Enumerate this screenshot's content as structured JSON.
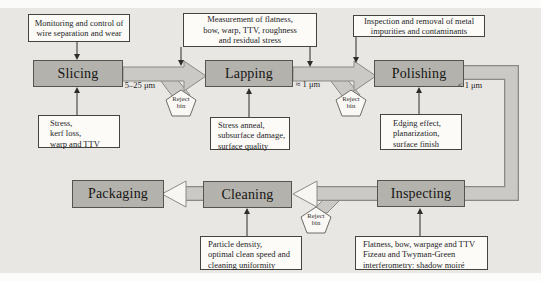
{
  "process_steps": {
    "slicing": {
      "label": "Slicing"
    },
    "lapping": {
      "label": "Lapping"
    },
    "polishing": {
      "label": "Polishing"
    },
    "packaging": {
      "label": "Packaging"
    },
    "cleaning": {
      "label": "Cleaning"
    },
    "inspecting": {
      "label": "Inspecting"
    }
  },
  "annotations": {
    "monitoring": {
      "lines": [
        "Monitoring and control of",
        "wire separation and wear"
      ]
    },
    "measurement": {
      "lines": [
        "Measurement of flatness,",
        "bow, warp, TTV, roughness",
        "and residual stress"
      ]
    },
    "inspection_removal": {
      "lines": [
        "Inspection and removal of metal",
        "impurities and contaminants"
      ]
    },
    "slicing_issues": {
      "lines": [
        "Stress,",
        "kerf loss,",
        "warp and TTV"
      ]
    },
    "lapping_issues": {
      "lines": [
        "Stress anneal,",
        "subsurface damage,",
        "surface quality"
      ]
    },
    "polishing_issues": {
      "lines": [
        "Edging effect,",
        "planarization,",
        "surface finish"
      ]
    },
    "cleaning_issues": {
      "lines": [
        "Particle density,",
        "optimal clean speed and",
        "cleaning uniformity"
      ]
    },
    "inspecting_methods": {
      "lines": [
        "Flatness, bow, warpage and TTV",
        "Fizeau and Twyman-Green",
        "interferometry: shadow moiré"
      ]
    }
  },
  "flow_labels": {
    "slicing_to_lapping": "5–25 μm",
    "lapping_to_polishing": "≈ 1 μm",
    "polishing_out": "< 1 μm"
  },
  "reject_bin": {
    "line1": "Reject",
    "line2": "bin"
  },
  "colors": {
    "panel_background": "#e8e7e3",
    "process_box_fill": "#b4b2ad",
    "process_box_border": "#56544e",
    "flow_arrow_fill": "#cac9c5",
    "flow_arrow_outline": "#8b8a85",
    "annotation_fill": "#fcfbf8",
    "annotation_border": "#45433e",
    "reject_bin_fill": "#f9f8f5",
    "connector_color": "#2f2d2a"
  }
}
